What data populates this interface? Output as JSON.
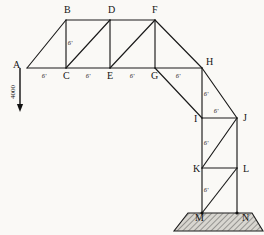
{
  "figure": {
    "type": "structural-truss-diagram",
    "background_color": "#faf9f6",
    "line_color": "#1a1a1a",
    "ground_fill_color": "#d8d6d0"
  },
  "nodes": [
    {
      "id": "A",
      "label": "A",
      "x": 27,
      "y": 68,
      "label_x": 13,
      "label_y": 68
    },
    {
      "id": "B",
      "label": "B",
      "x": 66,
      "y": 20,
      "label_x": 64,
      "label_y": 13
    },
    {
      "id": "C",
      "label": "C",
      "x": 66,
      "y": 68,
      "label_x": 63,
      "label_y": 79
    },
    {
      "id": "D",
      "label": "D",
      "x": 110,
      "y": 20,
      "label_x": 108,
      "label_y": 13
    },
    {
      "id": "E",
      "label": "E",
      "x": 110,
      "y": 68,
      "label_x": 107,
      "label_y": 79
    },
    {
      "id": "F",
      "label": "F",
      "x": 155,
      "y": 20,
      "label_x": 152,
      "label_y": 13
    },
    {
      "id": "G",
      "label": "G",
      "x": 155,
      "y": 68,
      "label_x": 151,
      "label_y": 79
    },
    {
      "id": "H",
      "label": "H",
      "x": 202,
      "y": 68,
      "label_x": 206,
      "label_y": 65
    },
    {
      "id": "I",
      "label": "I",
      "x": 202,
      "y": 118,
      "label_x": 194,
      "label_y": 122
    },
    {
      "id": "J",
      "label": "J",
      "x": 237,
      "y": 118,
      "label_x": 243,
      "label_y": 121
    },
    {
      "id": "K",
      "label": "K",
      "x": 202,
      "y": 168,
      "label_x": 193,
      "label_y": 172
    },
    {
      "id": "L",
      "label": "L",
      "x": 237,
      "y": 168,
      "label_x": 243,
      "label_y": 172
    },
    {
      "id": "M",
      "label": "M",
      "x": 202,
      "y": 213,
      "label_x": 195,
      "label_y": 221
    },
    {
      "id": "N",
      "label": "N",
      "x": 237,
      "y": 213,
      "label_x": 242,
      "label_y": 221
    }
  ],
  "members": [
    {
      "name": "A-B",
      "from": "A",
      "to": "B",
      "kind": "top-chord"
    },
    {
      "name": "B-D",
      "from": "B",
      "to": "D",
      "kind": "top-chord"
    },
    {
      "name": "D-F",
      "from": "D",
      "to": "F",
      "kind": "top-chord"
    },
    {
      "name": "F-H",
      "from": "F",
      "to": "H",
      "kind": "top-chord"
    },
    {
      "name": "H-J",
      "from": "H",
      "to": "J",
      "kind": "top-chord"
    },
    {
      "name": "A-C",
      "from": "A",
      "to": "C",
      "kind": "bottom-chord"
    },
    {
      "name": "C-E",
      "from": "C",
      "to": "E",
      "kind": "bottom-chord"
    },
    {
      "name": "E-G",
      "from": "E",
      "to": "G",
      "kind": "bottom-chord"
    },
    {
      "name": "G-H",
      "from": "G",
      "to": "H",
      "kind": "bottom-chord"
    },
    {
      "name": "B-C",
      "from": "B",
      "to": "C",
      "kind": "vertical"
    },
    {
      "name": "D-E",
      "from": "D",
      "to": "E",
      "kind": "vertical"
    },
    {
      "name": "F-G",
      "from": "F",
      "to": "G",
      "kind": "vertical"
    },
    {
      "name": "H-I",
      "from": "H",
      "to": "I",
      "kind": "vertical"
    },
    {
      "name": "I-K",
      "from": "I",
      "to": "K",
      "kind": "vertical"
    },
    {
      "name": "K-M",
      "from": "K",
      "to": "M",
      "kind": "vertical"
    },
    {
      "name": "J-L",
      "from": "J",
      "to": "L",
      "kind": "vertical"
    },
    {
      "name": "L-N",
      "from": "L",
      "to": "N",
      "kind": "vertical"
    },
    {
      "name": "I-J",
      "from": "I",
      "to": "J",
      "kind": "horizontal"
    },
    {
      "name": "K-L",
      "from": "K",
      "to": "L",
      "kind": "horizontal"
    },
    {
      "name": "C-D",
      "from": "C",
      "to": "D",
      "kind": "diagonal"
    },
    {
      "name": "E-F",
      "from": "E",
      "to": "F",
      "kind": "diagonal"
    },
    {
      "name": "G-I",
      "from": "G",
      "to": "I",
      "kind": "diagonal"
    },
    {
      "name": "K-J",
      "from": "K",
      "to": "J",
      "kind": "diagonal"
    },
    {
      "name": "M-L",
      "from": "M",
      "to": "L",
      "kind": "diagonal"
    }
  ],
  "dimensions": [
    {
      "name": "dim-A-C",
      "text": "6'",
      "x": 44,
      "y": 78
    },
    {
      "name": "dim-C-E",
      "text": "6'",
      "x": 88,
      "y": 78
    },
    {
      "name": "dim-E-G",
      "text": "6'",
      "x": 132,
      "y": 78
    },
    {
      "name": "dim-G-H",
      "text": "6'",
      "x": 178,
      "y": 78
    },
    {
      "name": "dim-B-C",
      "text": "6'",
      "x": 70,
      "y": 45
    },
    {
      "name": "dim-H-I",
      "text": "6'",
      "x": 206,
      "y": 96
    },
    {
      "name": "dim-I-J",
      "text": "6'",
      "x": 216,
      "y": 113
    },
    {
      "name": "dim-I-K",
      "text": "6'",
      "x": 206,
      "y": 145
    },
    {
      "name": "dim-K-M",
      "text": "6'",
      "x": 206,
      "y": 192
    }
  ],
  "load": {
    "name": "applied-load",
    "text": "4000",
    "node": "A",
    "direction": "down",
    "arrow_x": 20,
    "arrow_top_y": 68,
    "arrow_bottom_y": 112,
    "label_x": 15,
    "label_y": 92
  },
  "ground": {
    "name": "foundation",
    "supports": [
      "M",
      "N"
    ],
    "top_left_x": 188,
    "top_right_x": 252,
    "top_y": 213,
    "bottom_left_x": 174,
    "bottom_right_x": 263,
    "bottom_y": 231
  }
}
